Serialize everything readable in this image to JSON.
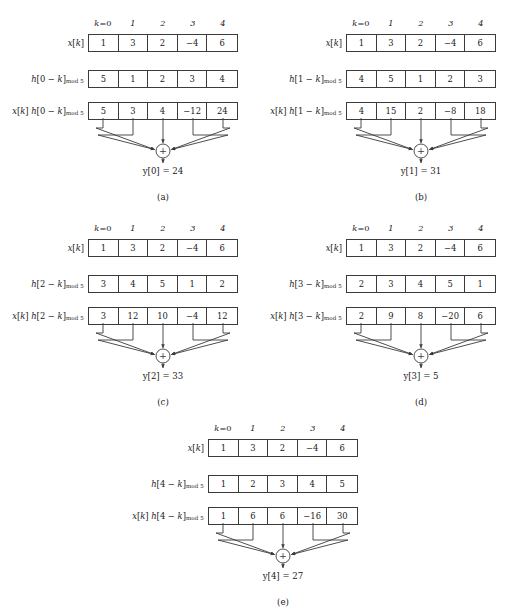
{
  "figure": {
    "index_label_prefix": "k",
    "index_label_first": "=0",
    "index_labels": [
      "1",
      "2",
      "3",
      "4"
    ]
  },
  "panels": [
    {
      "id": "a",
      "caption": "(a)",
      "row1_label_main": "x[k]",
      "row1_label_sub": "",
      "row2_label_main": "h[0 − k]",
      "row2_label_sub": "mod 5",
      "row3_label_main": "x[k] h[0 − k]",
      "row3_label_sub": "mod 5",
      "x": [
        "1",
        "3",
        "2",
        "−4",
        "6"
      ],
      "h": [
        "5",
        "1",
        "2",
        "3",
        "4"
      ],
      "prod": [
        "5",
        "3",
        "4",
        "−12",
        "24"
      ],
      "output": "y[0] = 24",
      "adder_symbol": "+"
    },
    {
      "id": "b",
      "caption": "(b)",
      "row1_label_main": "x[k]",
      "row1_label_sub": "",
      "row2_label_main": "h[1 − k]",
      "row2_label_sub": "mod 5",
      "row3_label_main": "x[k] h[1 − k]",
      "row3_label_sub": "mod 5",
      "x": [
        "1",
        "3",
        "2",
        "−4",
        "6"
      ],
      "h": [
        "4",
        "5",
        "1",
        "2",
        "3"
      ],
      "prod": [
        "4",
        "15",
        "2",
        "−8",
        "18"
      ],
      "output": "y[1] = 31",
      "adder_symbol": "+"
    },
    {
      "id": "c",
      "caption": "(c)",
      "row1_label_main": "x[k]",
      "row1_label_sub": "",
      "row2_label_main": "h[2 − k]",
      "row2_label_sub": "mod 5",
      "row3_label_main": "x[k] h[2 − k]",
      "row3_label_sub": "mod 5",
      "x": [
        "1",
        "3",
        "2",
        "−4",
        "6"
      ],
      "h": [
        "3",
        "4",
        "5",
        "1",
        "2"
      ],
      "prod": [
        "3",
        "12",
        "10",
        "−4",
        "12"
      ],
      "output": "y[2] = 33",
      "adder_symbol": "+"
    },
    {
      "id": "d",
      "caption": "(d)",
      "row1_label_main": "x[k]",
      "row1_label_sub": "",
      "row2_label_main": "h[3 − k]",
      "row2_label_sub": "mod 5",
      "row3_label_main": "x[k] h[3 − k]",
      "row3_label_sub": "mod 5",
      "x": [
        "1",
        "3",
        "2",
        "−4",
        "6"
      ],
      "h": [
        "2",
        "3",
        "4",
        "5",
        "1"
      ],
      "prod": [
        "2",
        "9",
        "8",
        "−20",
        "6"
      ],
      "output": "y[3] = 5",
      "adder_symbol": "+"
    },
    {
      "id": "e",
      "caption": "(e)",
      "row1_label_main": "x[k]",
      "row1_label_sub": "",
      "row2_label_main": "h[4 − k]",
      "row2_label_sub": "mod 5",
      "row3_label_main": "x[k] h[4 − k]",
      "row3_label_sub": "mod 5",
      "x": [
        "1",
        "3",
        "2",
        "−4",
        "6"
      ],
      "h": [
        "1",
        "2",
        "3",
        "4",
        "5"
      ],
      "prod": [
        "1",
        "6",
        "6",
        "−16",
        "30"
      ],
      "output": "y[4] = 27",
      "adder_symbol": "+"
    }
  ],
  "colors": {
    "stroke": "#3b3b3b",
    "text": "#1a1a1a",
    "background": "#ffffff"
  }
}
